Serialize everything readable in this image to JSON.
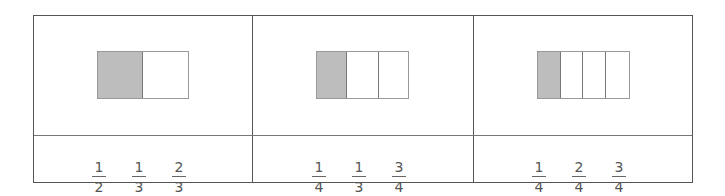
{
  "panels": [
    {
      "segments": 2,
      "shaded": 1,
      "fractions": [
        {
          "num": "1",
          "den": "2"
        },
        {
          "num": "1",
          "den": "3"
        },
        {
          "num": "2",
          "den": "3"
        }
      ]
    },
    {
      "segments": 3,
      "shaded": 1,
      "fractions": [
        {
          "num": "1",
          "den": "4"
        },
        {
          "num": "1",
          "den": "3"
        },
        {
          "num": "3",
          "den": "4"
        }
      ]
    },
    {
      "segments": 4,
      "shaded": 1,
      "fractions": [
        {
          "num": "1",
          "den": "4"
        },
        {
          "num": "2",
          "den": "4"
        },
        {
          "num": "3",
          "den": "4"
        }
      ]
    }
  ],
  "colors": {
    "shaded": "#bdbdbd",
    "border": "#555555"
  }
}
